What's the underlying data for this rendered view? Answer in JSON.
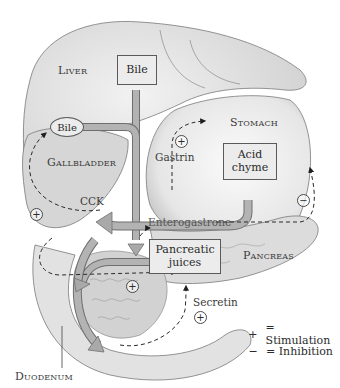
{
  "diagram": {
    "organs": {
      "liver": "Liver",
      "gallbladder": "Gallbladder",
      "stomach": "Stomach",
      "pancreas": "Pancreas",
      "duodenum": "Duodenum"
    },
    "boxes": {
      "bile_liver": "Bile",
      "bile_gallbladder": "Bile",
      "acid_chyme": "Acid chyme",
      "pancreatic_juices": "Pancreatic juices"
    },
    "hormones": {
      "gastrin": "Gastrin",
      "cck": "CCK",
      "enterogastrone": "Enterogastrone",
      "secretin": "Secretin"
    },
    "signs": {
      "gastrin_effect": "+",
      "cck_effect": "+",
      "enterogastrone_effect": "−",
      "duodenum_effect": "+",
      "secretin_effect": "+"
    },
    "legend": [
      {
        "symbol": "+",
        "label": "= Stimulation"
      },
      {
        "symbol": "−",
        "label": "= Inhibition"
      }
    ],
    "colors": {
      "flow_arrow": "#a9a9a9",
      "flow_arrow_edge": "#6e6e6e",
      "box_fill": "#ececec",
      "organ_shade": "#dcdcdc",
      "dashed_line": "#2a2a2a"
    }
  }
}
